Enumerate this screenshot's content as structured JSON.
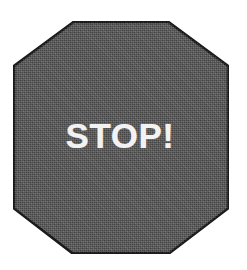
{
  "image": {
    "subject": "octagonal stop sign",
    "background_color": "#ffffff",
    "width": 247,
    "height": 270
  },
  "sign": {
    "shape": "octagon",
    "fill_color": "#585858",
    "border_color": "#1a1a1a",
    "border_width": 2,
    "texture": "dithered halftone grain",
    "label": "STOP!",
    "label_color": "#f2f2f2",
    "bounds": {
      "left": 13,
      "top": 21,
      "width": 216,
      "height": 233
    }
  }
}
